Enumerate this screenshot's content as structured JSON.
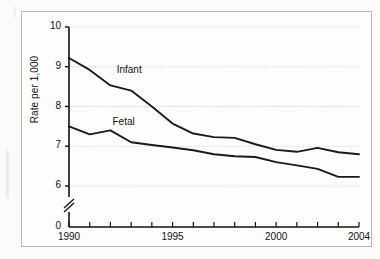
{
  "chart_data": {
    "type": "line",
    "title": "",
    "subtitle": "",
    "xlabel": "",
    "ylabel": "Rate per 1,000",
    "x": [
      1990,
      1991,
      1992,
      1993,
      1994,
      1995,
      1996,
      1997,
      1998,
      1999,
      2000,
      2001,
      2002,
      2003,
      2004
    ],
    "xlim": [
      1990,
      2004
    ],
    "ylim": [
      6,
      10
    ],
    "y_axis_break": true,
    "y_axis_break_label": "0",
    "yticks": [
      6,
      7,
      8,
      9,
      10
    ],
    "ytick_labels": [
      "6",
      "7",
      "8",
      "9",
      "10"
    ],
    "xticks": [
      1990,
      1991,
      1992,
      1993,
      1994,
      1995,
      1996,
      1997,
      1998,
      1999,
      2000,
      2001,
      2002,
      2003,
      2004
    ],
    "xtick_labels_shown": [
      "1990",
      "1995",
      "2000",
      "2004"
    ],
    "grid": "horizontal-dotted",
    "legend_position": "inline-annotations",
    "series": [
      {
        "name": "Infant",
        "label": "Infant",
        "color": "#1a1a1a",
        "values": [
          9.22,
          8.92,
          8.53,
          8.4,
          8.0,
          7.57,
          7.32,
          7.23,
          7.21,
          7.05,
          6.91,
          6.86,
          6.96,
          6.85,
          6.8
        ]
      },
      {
        "name": "Fetal",
        "label": "Fetal",
        "color": "#1a1a1a",
        "values": [
          7.5,
          7.3,
          7.4,
          7.1,
          7.03,
          6.97,
          6.9,
          6.8,
          6.75,
          6.73,
          6.6,
          6.52,
          6.43,
          6.23,
          6.23
        ]
      }
    ],
    "annotations": [
      {
        "text": "Infant",
        "x": 1992.3,
        "y": 8.93
      },
      {
        "text": "Fetal",
        "x": 1992.1,
        "y": 7.6
      }
    ]
  },
  "axis": {
    "ytick_10": "10",
    "ytick_9": "9",
    "ytick_8": "8",
    "ytick_7": "7",
    "ytick_6": "6",
    "ytick_0": "0",
    "xtick_1990": "1990",
    "xtick_1995": "1995",
    "xtick_2000": "2000",
    "xtick_2004": "2004",
    "ylabel": "Rate per 1,000"
  },
  "labels": {
    "infant": "Infant",
    "fetal": "Fetal"
  },
  "colors": {
    "line": "#1a1a1a",
    "grid": "#c9c9c9",
    "axis": "#111111",
    "frame": "#b9b9b7",
    "background": "#fdfdfc"
  }
}
